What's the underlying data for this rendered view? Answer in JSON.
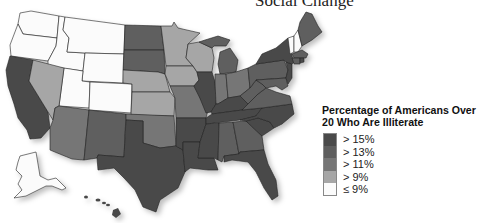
{
  "header": {
    "title": "Social Change"
  },
  "legend": {
    "title_line1": "Percentage of Americans Over",
    "title_line2": "20 Who Are Illiterate",
    "items": [
      {
        "label": "> 15%",
        "color": "#4a4a4a"
      },
      {
        "label": "> 13%",
        "color": "#5e5e5e"
      },
      {
        "label": "> 11%",
        "color": "#767676"
      },
      {
        "label": "> 9%",
        "color": "#a6a6a6"
      },
      {
        "label": "≤ 9%",
        "color": "#fbfbfb"
      }
    ]
  },
  "map": {
    "regions": {
      "gt15": [
        "California",
        "Texas",
        "Louisiana",
        "Mississippi",
        "Arkansas",
        "Tennessee",
        "Kentucky",
        "Illinois",
        "Florida",
        "South Carolina",
        "North Carolina",
        "Hawaii",
        "New York",
        "New Jersey",
        "Rhode Island"
      ],
      "gt13": [
        "North Dakota",
        "South Dakota",
        "New Mexico",
        "Alabama",
        "Georgia",
        "West Virginia",
        "Virginia",
        "Michigan",
        "Pennsylvania",
        "Massachusetts",
        "Connecticut",
        "Maine",
        "Maryland",
        "Delaware"
      ],
      "gt11": [
        "Arizona",
        "Oklahoma",
        "Missouri",
        "Indiana",
        "Ohio"
      ],
      "gt9": [
        "Nevada",
        "Nebraska",
        "Kansas",
        "Minnesota",
        "Iowa",
        "Wisconsin"
      ],
      "le9": [
        "Washington",
        "Oregon",
        "Idaho",
        "Montana",
        "Wyoming",
        "Utah",
        "Colorado",
        "Vermont",
        "New Hampshire",
        "Alaska"
      ]
    }
  }
}
